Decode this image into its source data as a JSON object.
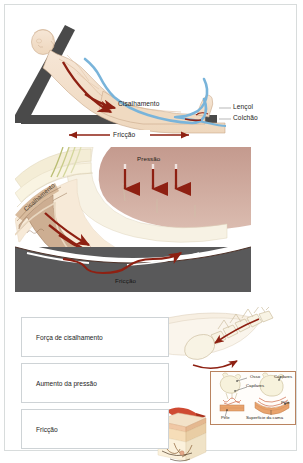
{
  "document": {
    "title": "Forças que causam lesão por pressão",
    "language": "pt-BR"
  },
  "colors": {
    "page_border": "#d8dcdc",
    "skin": "#f1dcc6",
    "skin_shadow": "#e2c4a6",
    "bed_rail": "#4a4a4a",
    "sheet_blue": "#79b4da",
    "arrow_red": "#8e2012",
    "mattress_gray": "#59595a",
    "tissue_pink": "#c9a397",
    "tissue_cream": "#f3ecd4",
    "bone_cream": "#f6f0dc",
    "inset_border": "#b9835f",
    "row_border": "#ced3d6",
    "text": "#1d1d1d"
  },
  "panel1": {
    "name": "Paciente em cama elevada",
    "labels": {
      "shear": "Cisalhamento",
      "sheet": "Lençol",
      "mattress": "Colchão",
      "friction": "Fricção"
    }
  },
  "panel2": {
    "name": "Corte transversal dos tecidos",
    "labels": {
      "pressure": "Pressão",
      "shear": "Cisalhamento",
      "friction": "Fricção"
    },
    "pressure_arrows": 3
  },
  "panel3": {
    "name": "Três forças",
    "rows": [
      {
        "label": "Força de cisalhamento"
      },
      {
        "label": "Aumento da pressão"
      },
      {
        "label": "Fricção"
      }
    ],
    "inset": {
      "name": "Capilares sob o osso",
      "labels": {
        "bone": "Osso",
        "capillaries_left": "Capilares",
        "capillaries_right": "Capilares",
        "skin_left": "Pele",
        "skin_right": "Pele",
        "bed_surface": "Superfície da cama"
      }
    }
  }
}
